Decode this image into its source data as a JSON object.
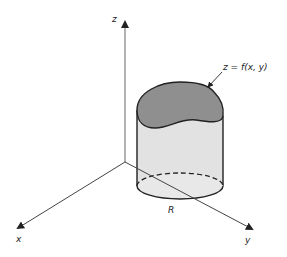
{
  "figure": {
    "axes": {
      "z_label": "z",
      "x_label": "x",
      "y_label": "y"
    },
    "surface_label": "z = f(x, y)",
    "region_label": "R",
    "colors": {
      "top_surface": "#8f8f8f",
      "side_surface": "#e2e2e2",
      "base_region": "#e8e8e8",
      "lines": "#222222",
      "axes": "#555555"
    }
  }
}
